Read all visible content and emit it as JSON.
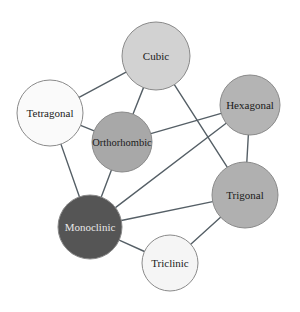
{
  "diagram": {
    "type": "network-graph",
    "title": "",
    "background_color": "#ffffff",
    "edge_color": "#555f66",
    "edge_width": 1.4,
    "node_border_color": "#8a8a8a",
    "label_color_dark": "#1a1a1a",
    "label_color_light": "#e8e8e8"
  },
  "nodes": [
    {
      "id": "cubic",
      "label": "Cubic",
      "x": 156,
      "y": 56,
      "r": 34,
      "fill": "#d2d2d2",
      "label_color": "#1a1a1a",
      "font_size": 11
    },
    {
      "id": "tetragonal",
      "label": "Tetragonal",
      "x": 50,
      "y": 113,
      "r": 33,
      "fill": "#fafafa",
      "label_color": "#1a1a1a",
      "font_size": 11
    },
    {
      "id": "orthorhombic",
      "label": "Orthorhombic",
      "x": 122,
      "y": 142,
      "r": 30,
      "fill": "#a8a8a8",
      "label_color": "#1a1a1a",
      "font_size": 10.5
    },
    {
      "id": "hexagonal",
      "label": "Hexagonal",
      "x": 250,
      "y": 105,
      "r": 30,
      "fill": "#b4b4b4",
      "label_color": "#1a1a1a",
      "font_size": 11
    },
    {
      "id": "trigonal",
      "label": "Trigonal",
      "x": 245,
      "y": 195,
      "r": 33,
      "fill": "#b0b0b0",
      "label_color": "#1a1a1a",
      "font_size": 11
    },
    {
      "id": "monoclinic",
      "label": "Monoclinic",
      "x": 90,
      "y": 227,
      "r": 32,
      "fill": "#555555",
      "label_color": "#e8e8e8",
      "font_size": 11
    },
    {
      "id": "triclinic",
      "label": "Triclinic",
      "x": 170,
      "y": 263,
      "r": 28,
      "fill": "#f5f5f5",
      "label_color": "#1a1a1a",
      "font_size": 11
    }
  ],
  "edges": [
    {
      "source": "cubic",
      "target": "tetragonal"
    },
    {
      "source": "cubic",
      "target": "orthorhombic"
    },
    {
      "source": "cubic",
      "target": "trigonal"
    },
    {
      "source": "tetragonal",
      "target": "orthorhombic"
    },
    {
      "source": "tetragonal",
      "target": "monoclinic"
    },
    {
      "source": "orthorhombic",
      "target": "hexagonal"
    },
    {
      "source": "orthorhombic",
      "target": "monoclinic"
    },
    {
      "source": "hexagonal",
      "target": "trigonal"
    },
    {
      "source": "hexagonal",
      "target": "monoclinic"
    },
    {
      "source": "trigonal",
      "target": "monoclinic"
    },
    {
      "source": "trigonal",
      "target": "triclinic"
    },
    {
      "source": "monoclinic",
      "target": "triclinic"
    }
  ]
}
